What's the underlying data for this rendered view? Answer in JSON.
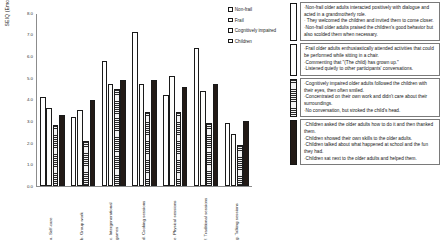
{
  "chart_data": {
    "type": "bar",
    "title": "",
    "xlabel": "",
    "ylabel": "SEIQ (Emotion) score ( mean )",
    "ylim": [
      0.0,
      8.0
    ],
    "grid": false,
    "legend_position": "top-right",
    "y_ticks": [
      "8.0",
      "7.0",
      "6.0",
      "5.0",
      "4.0",
      "3.0",
      "2.0",
      "1.0",
      "0.0"
    ],
    "categories": [
      "a. Self-care",
      "b. Group work",
      "c. Intergenerational games",
      "d. Cooking sessions",
      "e. Physical sessions",
      "f. Traditional sessions",
      "g. Talking sessions"
    ],
    "series": [
      {
        "name": "Non-frail",
        "pattern": "white",
        "values": [
          4.1,
          3.2,
          5.8,
          7.1,
          4.2,
          6.4,
          2.9
        ]
      },
      {
        "name": "Frail",
        "pattern": "dots",
        "values": [
          3.6,
          3.5,
          4.7,
          4.7,
          5.1,
          4.4,
          2.4
        ]
      },
      {
        "name": "Cognitively impaired",
        "pattern": "hlines",
        "values": [
          2.8,
          2.1,
          4.5,
          3.4,
          3.4,
          2.9,
          1.9
        ]
      },
      {
        "name": "Children",
        "pattern": "black",
        "values": [
          3.3,
          4.0,
          4.9,
          4.9,
          4.6,
          4.7,
          3.0
        ]
      }
    ]
  },
  "legend": {
    "items": [
      {
        "label": "Non-frail",
        "pattern": "white"
      },
      {
        "label": "Frail",
        "pattern": "dots"
      },
      {
        "label": "Cognitively impaired",
        "pattern": "hlines"
      },
      {
        "label": "Children",
        "pattern": "black"
      }
    ]
  },
  "notes": [
    {
      "pattern": "white",
      "lines": [
        "·Non-frail older adults interacted positively with dialogue and acted in a grandmotherly role.",
        "· They welcomed the children and invited them to come closer.",
        "·Non-frail older adults praised the children's good behavior but also scolded them when necessary."
      ]
    },
    {
      "pattern": "dots",
      "lines": [
        "·Frail older adults enthusiastically attended activities that could be performed while sitting in a chair.",
        "·Commenting that \"(The child) has grown up.\"",
        "·Listened quietly to other participants' conversations."
      ]
    },
    {
      "pattern": "hlines",
      "lines": [
        "·Cognitively impaired older adults followed the children with their eyes, then often smiled.",
        "·Concentrated on their own work and didn't care about their surroundings.",
        "·No conversation, but stroked the child's  head."
      ]
    },
    {
      "pattern": "black",
      "lines": [
        "·Children asked the older adults how to do it and then thanked them.",
        "·Children showed their own skills to the older adults.",
        "·Children talked about what happened at school and the fun they had.",
        "·Children sat next to the older adults and helped them."
      ]
    }
  ]
}
